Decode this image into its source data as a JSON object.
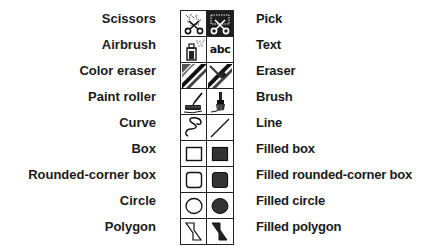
{
  "toolbox": {
    "left_labels": [
      "Scissors",
      "Airbrush",
      "Color eraser",
      "Paint roller",
      "Curve",
      "Box",
      "Rounded-corner box",
      "Circle",
      "Polygon"
    ],
    "right_labels": [
      "Pick",
      "Text",
      "Eraser",
      "Brush",
      "Line",
      "Filled box",
      "Filled rounded-corner box",
      "Filled circle",
      "Filled polygon"
    ],
    "tools": [
      {
        "left": {
          "name": "Scissors",
          "icon": "scissors-icon"
        },
        "right": {
          "name": "Pick",
          "icon": "pick-icon",
          "selected": true
        }
      },
      {
        "left": {
          "name": "Airbrush",
          "icon": "airbrush-icon"
        },
        "right": {
          "name": "Text",
          "icon": "text-icon",
          "glyph": "abc"
        }
      },
      {
        "left": {
          "name": "Color eraser",
          "icon": "color-eraser-icon"
        },
        "right": {
          "name": "Eraser",
          "icon": "eraser-icon"
        }
      },
      {
        "left": {
          "name": "Paint roller",
          "icon": "paint-roller-icon"
        },
        "right": {
          "name": "Brush",
          "icon": "brush-icon"
        }
      },
      {
        "left": {
          "name": "Curve",
          "icon": "curve-icon"
        },
        "right": {
          "name": "Line",
          "icon": "line-icon"
        }
      },
      {
        "left": {
          "name": "Box",
          "icon": "box-icon"
        },
        "right": {
          "name": "Filled box",
          "icon": "filled-box-icon"
        }
      },
      {
        "left": {
          "name": "Rounded-corner box",
          "icon": "rounded-box-icon"
        },
        "right": {
          "name": "Filled rounded-corner box",
          "icon": "filled-rounded-box-icon"
        }
      },
      {
        "left": {
          "name": "Circle",
          "icon": "circle-icon"
        },
        "right": {
          "name": "Filled circle",
          "icon": "filled-circle-icon"
        }
      },
      {
        "left": {
          "name": "Polygon",
          "icon": "polygon-icon"
        },
        "right": {
          "name": "Filled polygon",
          "icon": "filled-polygon-icon"
        }
      }
    ],
    "colors": {
      "ink": "#1a1a1a",
      "fill": "#333333",
      "selected_bg": "#1e1e1e",
      "border": "#222222"
    }
  }
}
